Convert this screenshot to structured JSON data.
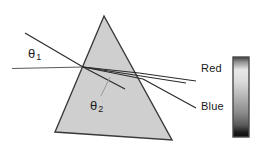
{
  "figure": {
    "background_color": "#ffffff",
    "prism": {
      "name": "triangular-prism",
      "fill_color": "#cfcfcf",
      "stroke_color": "#3a3a3a",
      "apex": {
        "x": 104,
        "y": 16
      },
      "bottom_left": {
        "x": 55,
        "y": 132
      },
      "bottom_right": {
        "x": 172,
        "y": 140
      }
    },
    "rays": {
      "incident": {
        "name": "incident-ray",
        "color": "#2b2b2b"
      },
      "normal_reference": {
        "name": "reference-line",
        "color": "#555555"
      },
      "internal": {
        "name": "internal-refracted-rays",
        "color": "#2b2b2b"
      },
      "emergent_red": {
        "name": "emergent-ray-red",
        "color": "#2b2b2b"
      },
      "emergent_blue": {
        "name": "emergent-ray-blue",
        "color": "#2b2b2b"
      },
      "leader": {
        "name": "theta2-leader-line",
        "color": "#9a9a9a"
      }
    },
    "angles": {
      "theta1": {
        "symbol": "θ",
        "subscript": "1"
      },
      "theta2": {
        "symbol": "θ",
        "subscript": "2"
      }
    },
    "colorbar": {
      "name": "spectrum-colorbar",
      "top_label": "Red",
      "bottom_label": "Blue",
      "border_color": "#4a4a4a",
      "gradient_top": "#3c3c3c",
      "gradient_upper_mid": "#e8e8e8",
      "gradient_mid": "#b4b4b4",
      "gradient_lower_mid": "#6a6a6a",
      "gradient_bottom": "#0d0d0d",
      "x": 233,
      "y": 57,
      "width": 16,
      "height": 80
    }
  }
}
